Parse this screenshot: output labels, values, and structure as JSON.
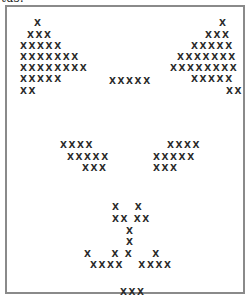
{
  "caption": {
    "text": "tus:"
  },
  "art": {
    "char": "X",
    "rows": [
      {
        "text": "X",
        "x": 27,
        "y": 11
      },
      {
        "text": "XXX",
        "x": 20,
        "y": 23
      },
      {
        "text": "XXXXX",
        "x": 13,
        "y": 34
      },
      {
        "text": "XXXXXXX",
        "x": 13,
        "y": 45
      },
      {
        "text": "XXXXXXXX",
        "x": 13,
        "y": 56
      },
      {
        "text": "XXXXX",
        "x": 13,
        "y": 67
      },
      {
        "text": "XX",
        "x": 13,
        "y": 79
      },
      {
        "text": "X",
        "x": 212,
        "y": 11
      },
      {
        "text": "XXX",
        "x": 198,
        "y": 23
      },
      {
        "text": "XXXXX",
        "x": 184,
        "y": 34
      },
      {
        "text": "XXXXXXX",
        "x": 170,
        "y": 45
      },
      {
        "text": "XXXXXXXX",
        "x": 163,
        "y": 56
      },
      {
        "text": "XXXXX",
        "x": 184,
        "y": 67
      },
      {
        "text": "XX",
        "x": 219,
        "y": 79
      },
      {
        "text": "XXXXX",
        "x": 102,
        "y": 69
      },
      {
        "text": "XXXX",
        "x": 53,
        "y": 133
      },
      {
        "text": "XXXXX",
        "x": 60,
        "y": 145
      },
      {
        "text": "XXX",
        "x": 75,
        "y": 156
      },
      {
        "text": "XXXX",
        "x": 160,
        "y": 133
      },
      {
        "text": "XXXXX",
        "x": 146,
        "y": 145
      },
      {
        "text": "XXX",
        "x": 146,
        "y": 156
      },
      {
        "text": "X   X",
        "x": 105,
        "y": 195
      },
      {
        "text": "XX XX",
        "x": 105,
        "y": 207
      },
      {
        "text": "X",
        "x": 119,
        "y": 219
      },
      {
        "text": "X",
        "x": 119,
        "y": 230
      },
      {
        "text": "X    X X    X",
        "x": 77,
        "y": 242
      },
      {
        "text": "XXXX   XXXX",
        "x": 83,
        "y": 253
      },
      {
        "text": "XXX",
        "x": 113,
        "y": 280
      }
    ]
  }
}
